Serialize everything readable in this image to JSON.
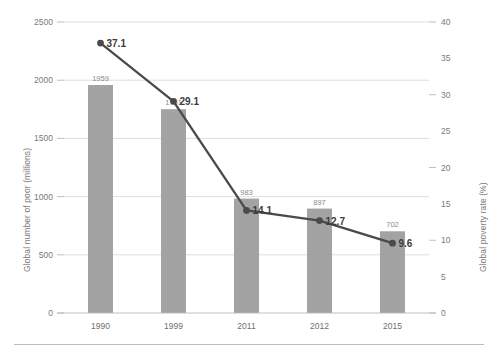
{
  "chart_data": {
    "type": "bar",
    "title": "",
    "subtitle": "",
    "categories": [
      "1990",
      "1999",
      "2011",
      "2012",
      "2015"
    ],
    "xlabel": "",
    "series": [
      {
        "name": "Global number of poor (millions)",
        "type": "bar",
        "axis": "left",
        "values": [
          1959,
          1751,
          983,
          897,
          702
        ],
        "labels": [
          "1959",
          "1751",
          "983",
          "897",
          "702"
        ],
        "color": "#a3a3a3"
      },
      {
        "name": "Global poverty rate (%)",
        "type": "line",
        "axis": "right",
        "values": [
          37.1,
          29.1,
          14.1,
          12.7,
          9.6
        ],
        "labels": [
          "37.1",
          "29.1",
          "14.1",
          "12.7",
          "9.6"
        ],
        "color": "#4a4a4a"
      }
    ],
    "left_axis": {
      "label": "Global number of poor (millions)",
      "ticks": [
        "0",
        "500",
        "1000",
        "1500",
        "2000",
        "2500"
      ],
      "tick_values": [
        0,
        500,
        1000,
        1500,
        2000,
        2500
      ],
      "ylim": [
        0,
        2500
      ]
    },
    "right_axis": {
      "label": "Global poverty rate (%)",
      "ticks": [
        "0",
        "5",
        "10",
        "15",
        "20",
        "25",
        "30",
        "35",
        "40"
      ],
      "tick_values": [
        0,
        5,
        10,
        15,
        20,
        25,
        30,
        35,
        40
      ],
      "ylim": [
        0,
        40
      ]
    },
    "grid": true,
    "gridlines_from": "left_axis",
    "legend": "none",
    "legend_position": "none",
    "colors": {
      "bar": "#a3a3a3",
      "line": "#4a4a4a",
      "gridline": "#d5d5d5",
      "axis": "#b9b9b9",
      "tick_text": "#7a7a7a",
      "background": "#ffffff"
    }
  }
}
